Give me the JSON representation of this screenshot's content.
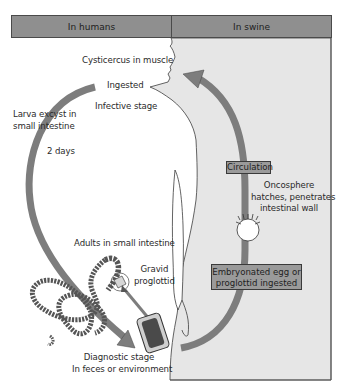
{
  "header": {
    "left_label": "In humans",
    "right_label": "In swine"
  },
  "humans": {
    "cysticercus": "Cysticercus in muscle",
    "ingested": "Ingested",
    "infective_stage": "Infective stage",
    "larva_line1": "Larva excyst in",
    "larva_line2": "small intestine",
    "days": "2 days",
    "adults": "Adults in small intestine",
    "gravid_line1": "Gravid",
    "gravid_line2": "proglottid",
    "diagnostic_line1": "Diagnostic stage",
    "diagnostic_line2": "In feces or environment"
  },
  "swine": {
    "circulation": "Circulation",
    "oncosphere_line1": "Oncosphere",
    "oncosphere_line2": "hatches, penetrates",
    "oncosphere_line3": "intestinal wall",
    "egg_line1": "Embryonated egg or",
    "egg_line2": "proglottid ingested"
  },
  "colors": {
    "header_fill": "#8f8f8f",
    "swine_bg": "#e6e6e6",
    "arrow_fill": "#7d7d7d",
    "box_fill": "#9a9a9a"
  }
}
